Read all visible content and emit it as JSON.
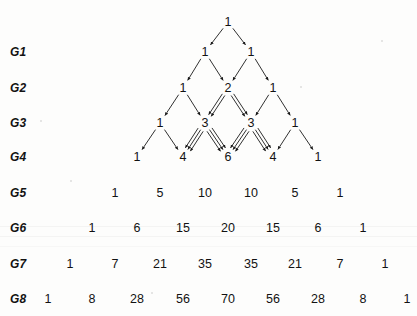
{
  "figure": {
    "ink_color": "#121212",
    "background_color": "#fdfdfc"
  },
  "generation_labels": [
    {
      "label": "G1",
      "x": 10,
      "y": 52
    },
    {
      "label": "G2",
      "x": 10,
      "y": 88
    },
    {
      "label": "G3",
      "x": 10,
      "y": 123
    },
    {
      "label": "G4",
      "x": 10,
      "y": 157
    },
    {
      "label": "G5",
      "x": 10,
      "y": 193
    },
    {
      "label": "G6",
      "x": 10,
      "y": 228
    },
    {
      "label": "G7",
      "x": 10,
      "y": 264
    },
    {
      "label": "G8",
      "x": 10,
      "y": 299
    }
  ],
  "chart_data": {
    "type": "diagram",
    "row_label_prefix": "G",
    "rows": [
      {
        "generation": 0,
        "label": "",
        "y": 22,
        "values": [
          1
        ],
        "x": [
          228
        ]
      },
      {
        "generation": 1,
        "label": "G1",
        "y": 52,
        "values": [
          1,
          1
        ],
        "x": [
          205,
          251
        ]
      },
      {
        "generation": 2,
        "label": "G2",
        "y": 88,
        "values": [
          1,
          2,
          1
        ],
        "x": [
          183,
          228,
          273
        ]
      },
      {
        "generation": 3,
        "label": "G3",
        "y": 123,
        "values": [
          1,
          3,
          3,
          1
        ],
        "x": [
          160,
          205,
          251,
          295
        ]
      },
      {
        "generation": 4,
        "label": "G4",
        "y": 157,
        "values": [
          1,
          4,
          6,
          4,
          1
        ],
        "x": [
          137,
          183,
          228,
          273,
          318
        ]
      },
      {
        "generation": 5,
        "label": "G5",
        "y": 193,
        "values": [
          1,
          5,
          10,
          10,
          5,
          1
        ],
        "x": [
          115,
          160,
          205,
          251,
          295,
          340
        ]
      },
      {
        "generation": 6,
        "label": "G6",
        "y": 228,
        "values": [
          1,
          6,
          15,
          20,
          15,
          6,
          1
        ],
        "x": [
          92,
          137,
          183,
          228,
          273,
          318,
          363
        ]
      },
      {
        "generation": 7,
        "label": "G7",
        "y": 264,
        "values": [
          1,
          7,
          21,
          35,
          35,
          21,
          7,
          1
        ],
        "x": [
          70,
          115,
          160,
          205,
          251,
          295,
          340,
          385
        ]
      },
      {
        "generation": 8,
        "label": "G8",
        "y": 299,
        "values": [
          1,
          8,
          28,
          56,
          70,
          56,
          28,
          8,
          1
        ],
        "x": [
          48,
          92,
          137,
          183,
          228,
          273,
          318,
          363,
          407
        ]
      }
    ],
    "arrow_rows": [
      0,
      1,
      2,
      3
    ],
    "arrow_note": "Each parent node emits a bundle of parallel arrows to each of its two children; the number of parallel arrows equals the parent's value.",
    "xlabel": "",
    "ylabel": "",
    "grid": false,
    "legend": false
  }
}
